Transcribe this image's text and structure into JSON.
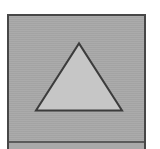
{
  "canvas": {
    "width": 160,
    "height": 149,
    "background_color": "#ffffff"
  },
  "panel": {
    "name": "shape-panel",
    "background_color": "#a8a8a8",
    "border_color": "#474747",
    "border_width": 2,
    "x": 7,
    "y": 14,
    "width": 139,
    "height": 135
  },
  "shape": {
    "type": "triangle",
    "label": "triangle",
    "fill_color": "#c6c6c6",
    "stroke_color": "#3c3c3c",
    "stroke_width": 2,
    "points": "70,27 113,93 27,93",
    "apex": {
      "x": 70,
      "y": 27
    },
    "base_left": {
      "x": 27,
      "y": 93
    },
    "base_right": {
      "x": 113,
      "y": 93
    }
  }
}
